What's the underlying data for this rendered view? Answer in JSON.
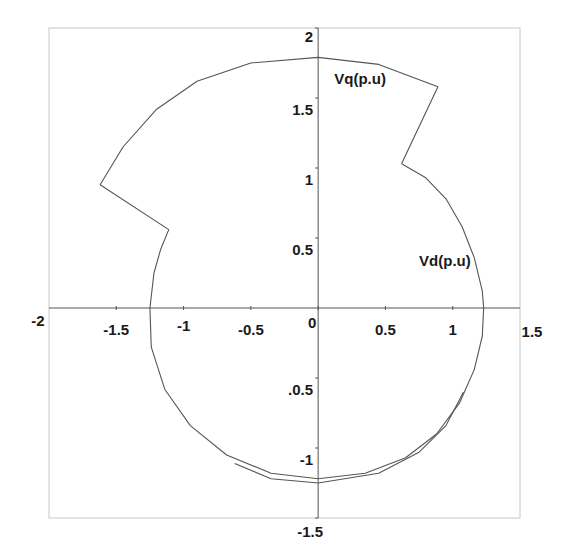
{
  "chart_data": {
    "type": "line",
    "title": "",
    "xlabel": "Vd(p.u)",
    "ylabel": "Vq(p.u)",
    "xlim": [
      -2,
      1.5
    ],
    "ylim": [
      -1.5,
      2
    ],
    "grid": false,
    "legend": null,
    "x_ticks": [
      {
        "value": -2,
        "label": "-2"
      },
      {
        "value": -1.5,
        "label": "-1.5"
      },
      {
        "value": -1,
        "label": "-1"
      },
      {
        "value": -0.5,
        "label": "-0.5"
      },
      {
        "value": 0,
        "label": "0"
      },
      {
        "value": 0.5,
        "label": "0.5"
      },
      {
        "value": 1,
        "label": "1"
      },
      {
        "value": 1.5,
        "label": "1.5"
      }
    ],
    "y_ticks": [
      {
        "value": 2,
        "label": "2"
      },
      {
        "value": 1.5,
        "label": "1.5"
      },
      {
        "value": 1,
        "label": "1"
      },
      {
        "value": 0.5,
        "label": "0.5"
      },
      {
        "value": -0.5,
        "label": ".0.5"
      },
      {
        "value": -1,
        "label": "-1"
      },
      {
        "value": -1.5,
        "label": "-1.5"
      }
    ],
    "annotations": [
      {
        "text": "Vq(p.u)",
        "x": 0.12,
        "y": 1.6
      },
      {
        "text": "Vd(p.u)",
        "x": 0.75,
        "y": 0.3
      }
    ],
    "series": [
      {
        "name": "trajectory",
        "description": "Vq vs Vd voltage trajectory: near-circular path with two sector notches (upper-right and upper-left)",
        "points": [
          [
            0.62,
            1.03
          ],
          [
            0.8,
            0.93
          ],
          [
            0.95,
            0.78
          ],
          [
            1.07,
            0.58
          ],
          [
            1.16,
            0.36
          ],
          [
            1.22,
            0.12
          ],
          [
            1.23,
            0.0
          ],
          [
            1.22,
            -0.2
          ],
          [
            1.16,
            -0.44
          ],
          [
            1.05,
            -0.68
          ],
          [
            0.88,
            -0.9
          ],
          [
            0.65,
            -1.07
          ],
          [
            0.35,
            -1.18
          ],
          [
            0.0,
            -1.22
          ],
          [
            -0.35,
            -1.18
          ],
          [
            -0.68,
            -1.05
          ],
          [
            -0.95,
            -0.84
          ],
          [
            -1.14,
            -0.58
          ],
          [
            -1.24,
            -0.28
          ],
          [
            -1.25,
            0.0
          ],
          [
            -1.22,
            0.25
          ],
          [
            -1.17,
            0.42
          ],
          [
            -1.11,
            0.56
          ],
          [
            -1.62,
            0.88
          ],
          [
            -1.45,
            1.15
          ],
          [
            -1.2,
            1.42
          ],
          [
            -0.9,
            1.62
          ],
          [
            -0.5,
            1.75
          ],
          [
            0.0,
            1.79
          ],
          [
            0.45,
            1.74
          ],
          [
            0.89,
            1.58
          ],
          [
            0.62,
            1.03
          ]
        ]
      },
      {
        "name": "trajectory-outer-arc",
        "description": "Second slightly larger lower arc segment",
        "points": [
          [
            1.08,
            -0.6
          ],
          [
            0.95,
            -0.84
          ],
          [
            0.75,
            -1.03
          ],
          [
            0.45,
            -1.18
          ],
          [
            0.0,
            -1.25
          ],
          [
            -0.35,
            -1.22
          ],
          [
            -0.62,
            -1.11
          ]
        ]
      }
    ]
  },
  "colors": {
    "line": "#555555",
    "axis": "#555555",
    "frame": "#c8c8c8",
    "text": "#1a1a1a",
    "background": "#ffffff"
  }
}
